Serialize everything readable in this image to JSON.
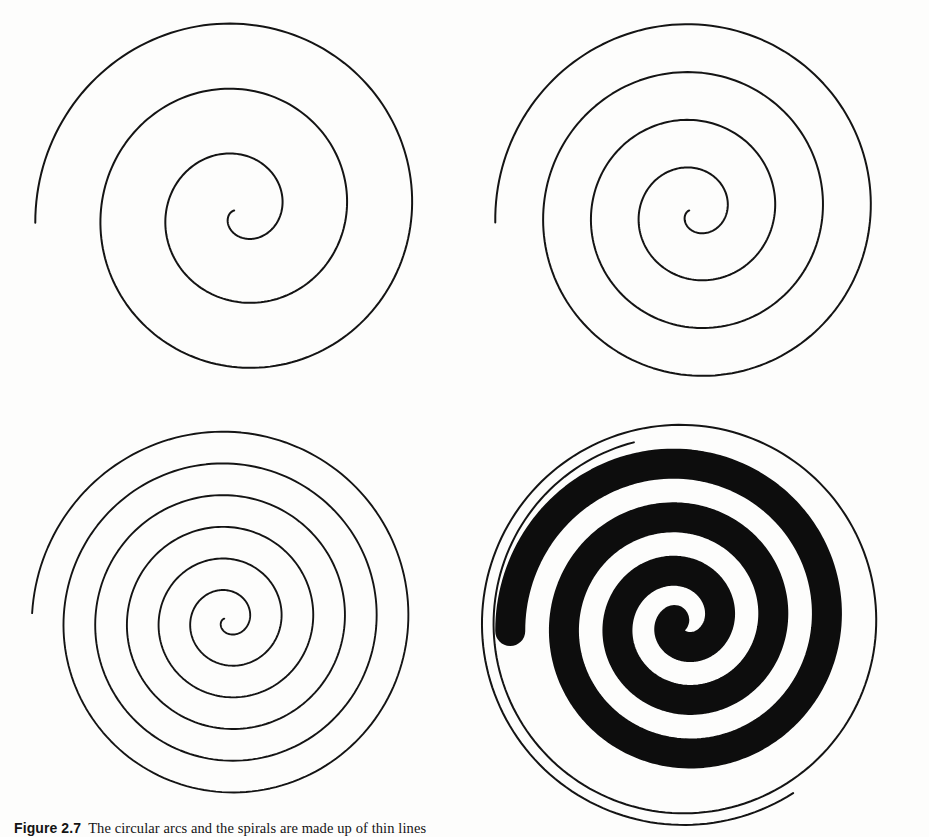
{
  "page": {
    "width": 929,
    "height": 837,
    "background_color": "#fdfdfc",
    "ink_color": "#111111",
    "kind": "scanned-book-figure"
  },
  "caption": {
    "label": "Figure 2.7",
    "text": "The circular arcs and the spirals are made up of thin lines"
  },
  "figure": {
    "panel_count": 4,
    "panels": [
      {
        "id": "panel-top-left",
        "name": "thin-spiral-three-turns",
        "position": {
          "left": 10,
          "top": 0,
          "width": 460,
          "height": 420
        },
        "center": {
          "x": 230,
          "y": 212
        },
        "spiral": {
          "type": "archimedean",
          "turns": 3.05,
          "r_start": 6,
          "r_end": 205,
          "start_angle_deg": 195,
          "direction": "counterclockwise",
          "stroke_width": 2.0,
          "stroke_color": "#141414",
          "fill": "none",
          "end_position_clock": "3 o'clock"
        },
        "outer_arc": null
      },
      {
        "id": "panel-top-right",
        "name": "thin-spiral-four-turns",
        "position": {
          "left": 460,
          "top": 0,
          "width": 460,
          "height": 420
        },
        "center": {
          "x": 235,
          "y": 212
        },
        "spiral": {
          "type": "archimedean",
          "turns": 4.05,
          "r_start": 6,
          "r_end": 200,
          "start_angle_deg": 195,
          "direction": "counterclockwise",
          "stroke_width": 2.0,
          "stroke_color": "#141414",
          "fill": "none",
          "end_position_clock": "3 o'clock"
        },
        "outer_arc": null
      },
      {
        "id": "panel-bottom-left",
        "name": "thin-spiral-six-turns",
        "position": {
          "left": 0,
          "top": 420,
          "width": 470,
          "height": 400
        },
        "center": {
          "x": 228,
          "y": 200
        },
        "spiral": {
          "type": "archimedean",
          "turns": 6.05,
          "r_start": 4,
          "r_end": 196,
          "start_angle_deg": 200,
          "direction": "counterclockwise",
          "stroke_width": 1.9,
          "stroke_color": "#141414",
          "fill": "none",
          "end_position_clock": "3 o'clock"
        },
        "outer_arc": null
      },
      {
        "id": "panel-bottom-right",
        "name": "thick-filled-spiral-with-outer-arc",
        "position": {
          "left": 460,
          "top": 420,
          "width": 470,
          "height": 400
        },
        "center": {
          "x": 222,
          "y": 202
        },
        "spiral": {
          "type": "archimedean",
          "turns": 3.05,
          "r_start": 8,
          "r_end": 172,
          "start_angle_deg": 195,
          "direction": "counterclockwise",
          "stroke_width": 30,
          "stroke_color": "#0d0d0d",
          "fill": "none",
          "end_position_clock": "3 o'clock"
        },
        "outer_arc": {
          "name": "thin-outer-spiral-arc",
          "type": "archimedean",
          "turns": 1.55,
          "r_start": 186,
          "r_end": 204,
          "start_angle_deg": 255,
          "direction": "counterclockwise",
          "stroke_width": 2.0,
          "stroke_color": "#141414"
        }
      }
    ]
  },
  "chart_data": {
    "type": "line",
    "xlabel": "",
    "ylabel": "",
    "series": [
      {
        "name": "top-left spiral",
        "turns": 3,
        "stroke_width_px": 2,
        "filled": false
      },
      {
        "name": "top-right spiral",
        "turns": 4,
        "stroke_width_px": 2,
        "filled": false
      },
      {
        "name": "bottom-left spiral",
        "turns": 6,
        "stroke_width_px": 2,
        "filled": false
      },
      {
        "name": "bottom-right spiral",
        "turns": 3,
        "stroke_width_px": 30,
        "filled": true
      }
    ]
  }
}
